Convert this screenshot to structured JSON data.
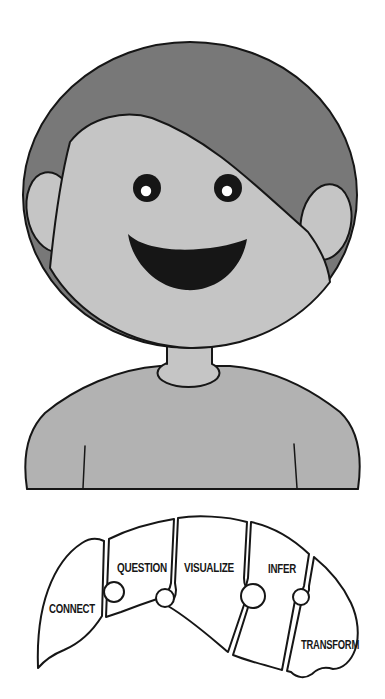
{
  "colors": {
    "hair": "#787878",
    "skin": "#c5c5c5",
    "shirt": "#b2b2b2",
    "line": "#161616",
    "piece": "#ffffff",
    "label": "#161616"
  },
  "puzzle": {
    "pieces": [
      {
        "label": "CONNECT"
      },
      {
        "label": "QUESTION"
      },
      {
        "label": "VISUALIZE"
      },
      {
        "label": "INFER"
      },
      {
        "label": "TRANSFORM"
      }
    ]
  }
}
